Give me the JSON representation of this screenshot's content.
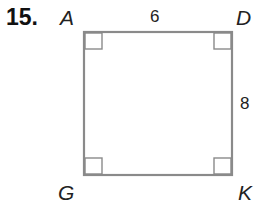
{
  "problem": {
    "number": "15."
  },
  "figure": {
    "shape": "rectangle",
    "vertices": {
      "top_left": "A",
      "top_right": "D",
      "bottom_left": "G",
      "bottom_right": "K"
    },
    "side_labels": {
      "top": "6",
      "right": "8"
    },
    "right_angle_marks": [
      "A",
      "D",
      "G",
      "K"
    ],
    "colors": {
      "stroke": "#8a8a8a",
      "text": "#222222"
    }
  }
}
